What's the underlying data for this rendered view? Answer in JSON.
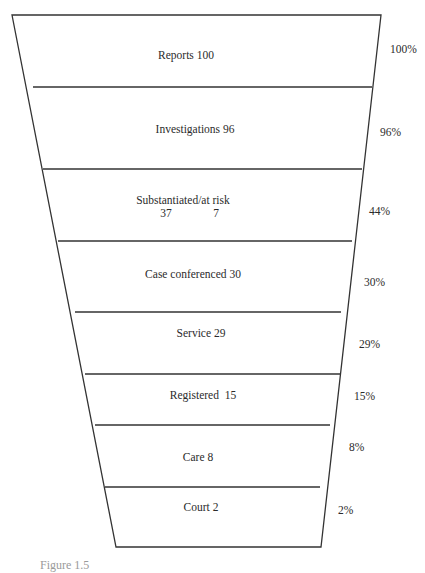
{
  "diagram": {
    "type": "funnel",
    "outline": {
      "top_left": [
        12,
        15
      ],
      "top_right": [
        381,
        15
      ],
      "bottom_left": [
        116,
        547
      ],
      "bottom_right": [
        321,
        547
      ]
    },
    "line_color": "#333333",
    "dividers": [
      {
        "y": 87,
        "x1": 33,
        "x2": 372
      },
      {
        "y": 169,
        "x1": 43,
        "x2": 362
      },
      {
        "y": 241,
        "x1": 58,
        "x2": 352
      },
      {
        "y": 312,
        "x1": 75,
        "x2": 341
      },
      {
        "y": 374,
        "x1": 85,
        "x2": 340
      },
      {
        "y": 425,
        "x1": 95,
        "x2": 330
      },
      {
        "y": 487,
        "x1": 105,
        "x2": 320
      }
    ],
    "stages": [
      {
        "label": "Reports 100",
        "x": 186,
        "y": 56,
        "percent": "100%",
        "px": 390,
        "py": 50
      },
      {
        "label": "Investigations 96",
        "x": 195,
        "y": 130,
        "percent": "96%",
        "px": 380,
        "py": 133
      },
      {
        "label": "Substantiated/at risk",
        "x": 183,
        "y": 201,
        "percent": "44%",
        "px": 369,
        "py": 212,
        "sub_values": [
          {
            "text": "37",
            "x": 166,
            "y": 214
          },
          {
            "text": "7",
            "x": 216,
            "y": 214
          }
        ]
      },
      {
        "label": "Case conferenced 30",
        "x": 193,
        "y": 275,
        "percent": "30%",
        "px": 364,
        "py": 283
      },
      {
        "label": "Service 29",
        "x": 201,
        "y": 334,
        "percent": "29%",
        "px": 359,
        "py": 345
      },
      {
        "label": "Registered  15",
        "x": 203,
        "y": 396,
        "percent": "15%",
        "px": 354,
        "py": 397
      },
      {
        "label": "Care 8",
        "x": 198,
        "y": 458,
        "percent": "8%",
        "px": 349,
        "py": 448
      },
      {
        "label": "Court 2",
        "x": 201,
        "y": 508,
        "percent": "2%",
        "px": 338,
        "py": 511
      }
    ]
  },
  "caption": "Figure 1.5"
}
